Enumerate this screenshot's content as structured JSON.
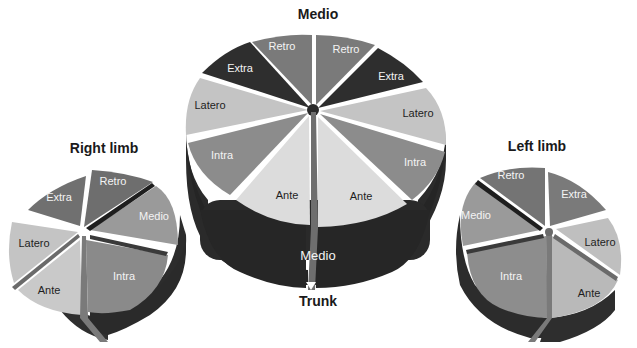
{
  "diagram": {
    "titles": {
      "top": "Medio",
      "bottom": "Trunk",
      "left": "Right limb",
      "right": "Left limb"
    },
    "trunk": {
      "segments": [
        {
          "label": "Retro",
          "side": "left"
        },
        {
          "label": "Retro",
          "side": "right"
        },
        {
          "label": "Extra",
          "side": "left"
        },
        {
          "label": "Extra",
          "side": "right"
        },
        {
          "label": "Latero",
          "side": "left"
        },
        {
          "label": "Latero",
          "side": "right"
        },
        {
          "label": "Intra",
          "side": "left"
        },
        {
          "label": "Intra",
          "side": "right"
        },
        {
          "label": "Ante",
          "side": "left"
        },
        {
          "label": "Ante",
          "side": "right"
        }
      ],
      "side_label": "Medio"
    },
    "right_limb": {
      "segments": [
        {
          "label": "Retro"
        },
        {
          "label": "Extra"
        },
        {
          "label": "Medio"
        },
        {
          "label": "Latero"
        },
        {
          "label": "Intra"
        },
        {
          "label": "Ante"
        }
      ]
    },
    "left_limb": {
      "segments": [
        {
          "label": "Retro"
        },
        {
          "label": "Extra"
        },
        {
          "label": "Medio"
        },
        {
          "label": "Latero"
        },
        {
          "label": "Intra"
        },
        {
          "label": "Ante"
        }
      ]
    },
    "colors": {
      "retro": "#7a7a7a",
      "extra": "#2e2e2e",
      "latero": "#c4c4c4",
      "intra": "#8c8c8c",
      "ante": "#dcdcdc",
      "medio": "#9a9a9a",
      "side_dark": "#2b2b2b",
      "divider": "#555555"
    }
  }
}
